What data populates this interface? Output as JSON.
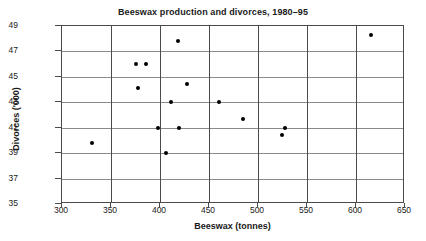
{
  "chart_data": {
    "type": "scatter",
    "title": "Beeswax production and divorces, 1980–95",
    "xlabel": "Beeswax (tonnes)",
    "ylabel": "Divorces ('000)",
    "xlim": [
      300,
      650
    ],
    "ylim": [
      35,
      49
    ],
    "xticks": [
      300,
      350,
      400,
      450,
      500,
      550,
      600,
      650
    ],
    "yticks": [
      35,
      37,
      39,
      41,
      43,
      45,
      47,
      49
    ],
    "grid": "horizontal-and-vertical",
    "legend": "none",
    "marker": "filled-circle",
    "marker_color": "#000000",
    "series": [
      {
        "name": "Beeswax vs divorces",
        "points": [
          {
            "x": 331,
            "y": 39.8
          },
          {
            "x": 376,
            "y": 46.0
          },
          {
            "x": 386,
            "y": 46.0
          },
          {
            "x": 378,
            "y": 44.1
          },
          {
            "x": 398,
            "y": 41.0
          },
          {
            "x": 406,
            "y": 39.0
          },
          {
            "x": 411,
            "y": 43.0
          },
          {
            "x": 418,
            "y": 47.8
          },
          {
            "x": 419,
            "y": 41.0
          },
          {
            "x": 428,
            "y": 44.4
          },
          {
            "x": 460,
            "y": 43.0
          },
          {
            "x": 485,
            "y": 41.7
          },
          {
            "x": 524,
            "y": 40.4
          },
          {
            "x": 528,
            "y": 41.0
          },
          {
            "x": 615,
            "y": 48.3
          }
        ]
      }
    ]
  }
}
